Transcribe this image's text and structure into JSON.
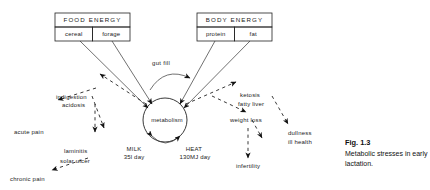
{
  "figure": {
    "caption_title": "Fig. 1.3",
    "caption_body": "Metabolic stresses in early lactation."
  },
  "sources": [
    {
      "id": "food-energy",
      "title": "FOOD ENERGY",
      "components": [
        "cereal",
        "forage"
      ]
    },
    {
      "id": "body-energy",
      "title": "BODY ENERGY",
      "components": [
        "protein",
        "fat"
      ]
    }
  ],
  "center": {
    "label": "metabolism"
  },
  "flow_label": {
    "gut_fill": "gut fill"
  },
  "outputs": [
    {
      "id": "milk",
      "name": "MILK",
      "value": "35l day"
    },
    {
      "id": "heat",
      "name": "HEAT",
      "value": "130MJ day"
    }
  ],
  "left_chain": [
    {
      "id": "indigestion",
      "label": "indigestion"
    },
    {
      "id": "acidosis",
      "label": "acidosis"
    },
    {
      "id": "laminitis",
      "label": "laminitis"
    },
    {
      "id": "solar-ulcer",
      "label": "solar ulcer"
    },
    {
      "id": "acute-pain",
      "label": "acute pain"
    },
    {
      "id": "chronic-pain",
      "label": "chronic pain"
    }
  ],
  "right_chain": [
    {
      "id": "ketosis",
      "label": "ketosis"
    },
    {
      "id": "fatty-liver",
      "label": "fatty liver"
    },
    {
      "id": "weight-loss",
      "label": "weight loss"
    },
    {
      "id": "infertility",
      "label": "infertility"
    },
    {
      "id": "dullness",
      "label": "dullness"
    },
    {
      "id": "ill-health",
      "label": "ill health"
    }
  ],
  "colors": {
    "ink": "#1a1a1a",
    "background": "#ffffff"
  }
}
